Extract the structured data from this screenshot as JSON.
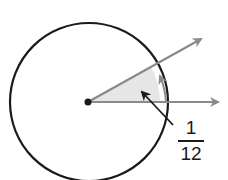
{
  "diagram": {
    "type": "circle-angle",
    "label": {
      "numerator": "1",
      "denominator": "12"
    },
    "colors": {
      "circle": "#1a1a1a",
      "rays": "#8a8a8a",
      "sector": "#e6e6e6",
      "pointer": "#1a1a1a"
    }
  }
}
